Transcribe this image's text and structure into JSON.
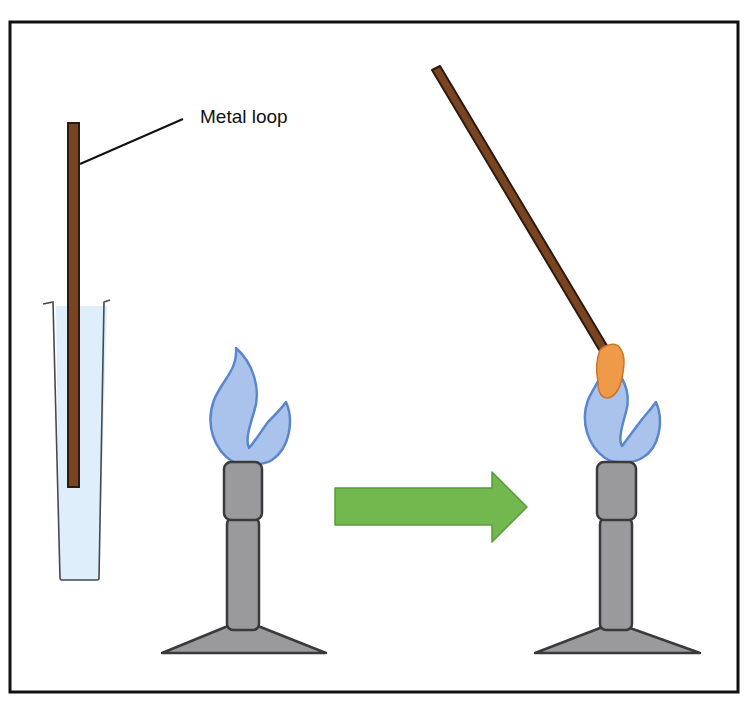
{
  "diagram": {
    "type": "flame-test-procedure",
    "labels": {
      "metal_loop": "Metal loop"
    },
    "elements": [
      {
        "name": "test-tube",
        "description": "Test tube containing light blue solution with metal loop dipped in"
      },
      {
        "name": "metal-loop-in-tube",
        "description": "Vertical brown metal loop rod"
      },
      {
        "name": "bunsen-burner-left",
        "description": "Bunsen burner with blue flame"
      },
      {
        "name": "process-arrow",
        "description": "Green right-pointing arrow"
      },
      {
        "name": "bunsen-burner-right",
        "description": "Bunsen burner with blue flame"
      },
      {
        "name": "metal-loop-in-flame",
        "description": "Angled metal loop with orange sample held in flame"
      }
    ],
    "colors": {
      "border": "#111111",
      "rod": "#7a4420",
      "rod_outline": "#2a1a10",
      "solution": "#deeefa",
      "flame_fill": "#a9c3ec",
      "flame_outline": "#5b86cc",
      "burner_fill": "#9a9a9c",
      "burner_outline": "#3a3a3c",
      "arrow_fill": "#72b84e",
      "arrow_outline": "#5a9a3c",
      "sample": "#ee9a48",
      "sample_outline": "#c8762a"
    }
  }
}
